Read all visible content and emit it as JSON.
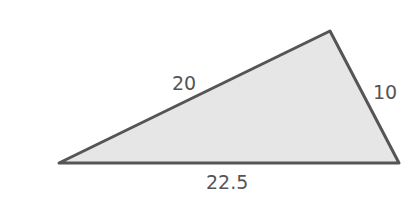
{
  "diagram": {
    "type": "triangle",
    "fill_color": "#e6e6e6",
    "stroke_color": "#555555",
    "vertices": [
      [
        59,
        163
      ],
      [
        330,
        31
      ],
      [
        399,
        163
      ]
    ],
    "side_labels": {
      "left_side": "20",
      "right_side": "10",
      "base": "22.5"
    }
  }
}
